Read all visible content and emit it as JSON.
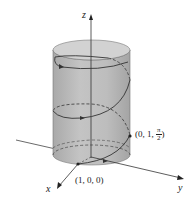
{
  "figure": {
    "axes": {
      "x_label": "x",
      "y_label": "y",
      "z_label": "z"
    },
    "points": [
      {
        "label": "(1, 0, 0)",
        "coords": "(1, 0, 0)"
      },
      {
        "label_prefix": "(0, 1, ",
        "label_frac_num": "π",
        "label_frac_den": "2",
        "label_suffix": ")"
      }
    ],
    "colors": {
      "cylinder_fill": "#bdbdbd",
      "cylinder_top": "#cfcfcf",
      "curve": "#333333",
      "axis": "#333333"
    }
  }
}
